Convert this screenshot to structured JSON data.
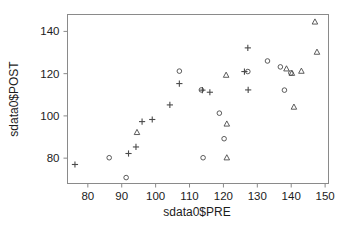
{
  "chart_data": {
    "type": "scatter",
    "title": "",
    "xlabel": "sdata0$PRE",
    "ylabel": "sdata0$POST",
    "xlim": [
      74,
      151
    ],
    "ylim": [
      68,
      148
    ],
    "xticks": [
      80,
      90,
      100,
      110,
      120,
      130,
      140,
      150
    ],
    "yticks": [
      80,
      100,
      120,
      140
    ],
    "grid": false,
    "legend": false,
    "marker_color": "#4a4a4a",
    "frame_color": "#8a8a8a",
    "background": "#ffffff",
    "series": [
      {
        "name": "plus",
        "marker": "plus",
        "points": [
          [
            76.2,
            77.0
          ],
          [
            92.0,
            82.2
          ],
          [
            94.2,
            85.3
          ],
          [
            96.0,
            97.3
          ],
          [
            99.0,
            98.3
          ],
          [
            104.2,
            105.2
          ],
          [
            107.0,
            115.3
          ],
          [
            113.8,
            112.2
          ],
          [
            116.0,
            111.2
          ],
          [
            126.2,
            121.0
          ],
          [
            127.2,
            132.2
          ],
          [
            127.3,
            112.3
          ]
        ]
      },
      {
        "name": "circle",
        "marker": "circle",
        "points": [
          [
            86.3,
            80.2
          ],
          [
            91.3,
            70.8
          ],
          [
            107.0,
            121.2
          ],
          [
            113.5,
            112.3
          ],
          [
            114.0,
            80.2
          ],
          [
            118.8,
            101.3
          ],
          [
            120.2,
            89.2
          ],
          [
            127.2,
            121.0
          ],
          [
            133.0,
            126.0
          ],
          [
            136.8,
            123.2
          ],
          [
            138.0,
            112.2
          ],
          [
            139.9,
            120.3
          ]
        ]
      },
      {
        "name": "triangle",
        "marker": "triangle",
        "points": [
          [
            94.5,
            92.2
          ],
          [
            120.8,
            119.3
          ],
          [
            121.0,
            96.2
          ],
          [
            121.0,
            80.2
          ],
          [
            138.6,
            122.3
          ],
          [
            140.2,
            120.2
          ],
          [
            140.8,
            104.2
          ],
          [
            143.0,
            121.2
          ],
          [
            147.0,
            144.5
          ],
          [
            147.6,
            130.2
          ]
        ]
      }
    ]
  },
  "axes": {
    "x_title": "sdata0$PRE",
    "y_title": "sdata0$POST",
    "x_tick_labels": [
      "80",
      "90",
      "100",
      "110",
      "120",
      "130",
      "140",
      "150"
    ],
    "y_tick_labels": [
      "80",
      "100",
      "120",
      "140"
    ]
  }
}
